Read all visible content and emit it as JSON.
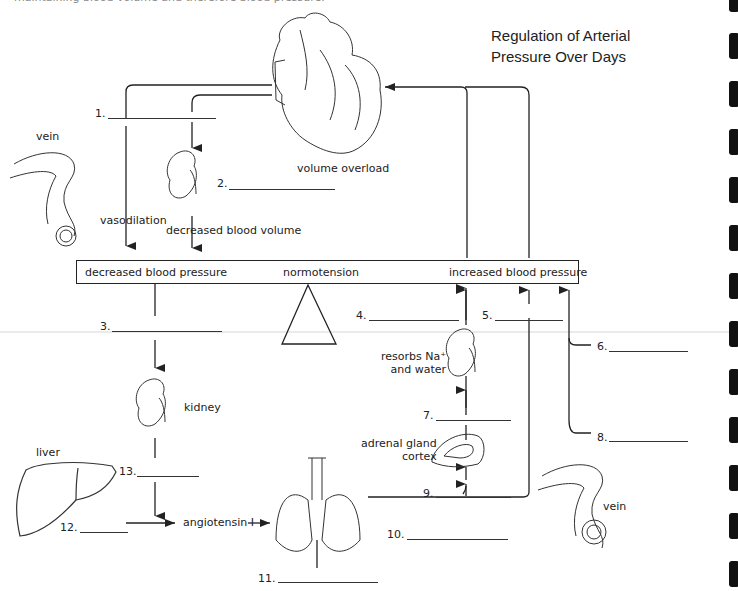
{
  "caption": "maintaining blood volume and therefore blood pressure.",
  "title": {
    "line1": "Regulation of Arterial",
    "line2": "Pressure Over Days"
  },
  "balance_bar": {
    "left": "decreased blood pressure",
    "center": "normotension",
    "right": "increased blood pressure"
  },
  "labels": {
    "volume_overload": "volume overload",
    "vein_left": "vein",
    "vein_right": "vein",
    "vasodilation": "vasodilation",
    "decreased_blood_volume": "decreased blood volume",
    "kidney": "kidney",
    "liver": "liver",
    "angiotensin_i": "angiotensin I",
    "resorbs_line1": "resorbs Na⁺",
    "resorbs_line2": "and water",
    "adrenal_line1": "adrenal gland",
    "adrenal_line2": "cortex"
  },
  "blanks": [
    {
      "number": "1.",
      "value": ""
    },
    {
      "number": "2.",
      "value": ""
    },
    {
      "number": "3.",
      "value": ""
    },
    {
      "number": "4.",
      "value": ""
    },
    {
      "number": "5.",
      "value": ""
    },
    {
      "number": "6.",
      "value": ""
    },
    {
      "number": "7.",
      "value": ""
    },
    {
      "number": "8.",
      "value": ""
    },
    {
      "number": "9.",
      "value": ""
    },
    {
      "number": "10.",
      "value": ""
    },
    {
      "number": "11.",
      "value": ""
    },
    {
      "number": "12.",
      "value": ""
    },
    {
      "number": "13.",
      "value": ""
    }
  ],
  "colors": {
    "line": "#222222",
    "text": "#222222",
    "binding_marks": "#111111"
  }
}
